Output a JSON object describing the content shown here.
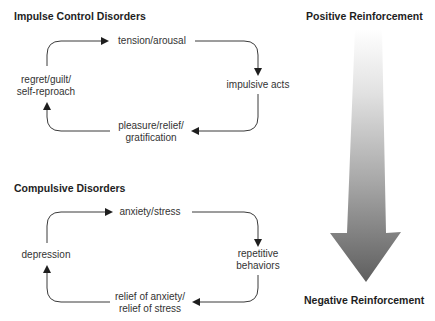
{
  "impulse": {
    "title": "Impulse Control Disorders",
    "nodes": {
      "top": "tension/arousal",
      "right": "impulsive acts",
      "bottom_line1": "pleasure/relief/",
      "bottom_line2": "gratification",
      "left_line1": "regret/guilt/",
      "left_line2": "self-reproach"
    }
  },
  "compulsive": {
    "title": "Compulsive Disorders",
    "nodes": {
      "top": "anxiety/stress",
      "right_line1": "repetitive",
      "right_line2": "behaviors",
      "bottom_line1": "relief of anxiety/",
      "bottom_line2": "relief of stress",
      "left": "depression"
    }
  },
  "spectrum": {
    "top_label": "Positive Reinforcement",
    "bottom_label": "Negative Reinforcement",
    "colors": {
      "top": "#ffffff",
      "bottom": "#5a5a5a"
    }
  }
}
